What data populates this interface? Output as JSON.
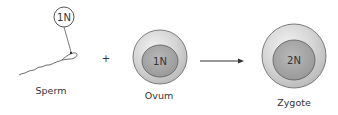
{
  "diagram": {
    "sperm": {
      "label": "Sperm",
      "ploidy": "1N"
    },
    "operator": "+",
    "ovum": {
      "label": "Ovum",
      "ploidy": "1N"
    },
    "zygote": {
      "label": "Zygote",
      "ploidy": "2N"
    },
    "colors": {
      "outer_cell": "#d6d6d6",
      "outer_stroke": "#6e6e6e",
      "nucleus": "#a8a8a8",
      "nucleus_stroke": "#5a5a5a",
      "line": "#333333"
    }
  }
}
